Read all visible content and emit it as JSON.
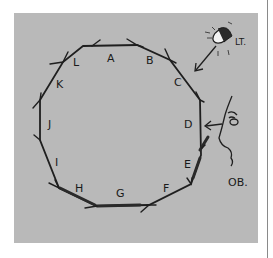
{
  "diagram": {
    "type": "hand-drawn polygon diagram",
    "polygon": {
      "sides": 12,
      "vertex_labels": [
        "A",
        "B",
        "C",
        "D",
        "E",
        "F",
        "G",
        "H",
        "I",
        "J",
        "K",
        "L"
      ],
      "direction": "clockwise arrows on each side"
    },
    "light_source": {
      "label": "LT.",
      "icon": "lamp-icon",
      "arrow_target": "C"
    },
    "observer": {
      "label": "OB.",
      "icon": "face-profile-icon",
      "arrow_target": "D"
    },
    "colors": {
      "background": "#ffffff",
      "panel": "#b9b9b9",
      "ink": "#1a1a1a"
    }
  }
}
